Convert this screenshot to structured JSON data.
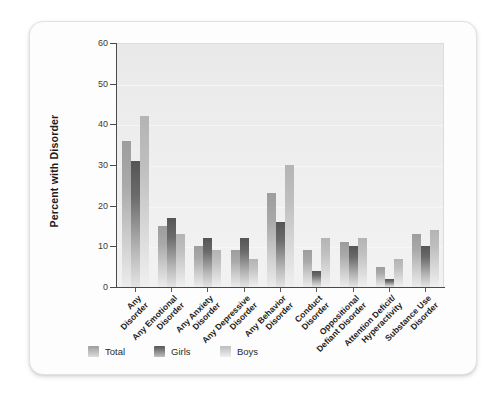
{
  "chart_data": {
    "type": "bar",
    "title": "",
    "xlabel": "",
    "ylabel": "Percent with Disorder",
    "ylim": [
      0,
      60
    ],
    "yticks": [
      0,
      10,
      20,
      30,
      40,
      50,
      60
    ],
    "grid": true,
    "legend_position": "bottom",
    "categories": [
      "Any Disorder",
      "Any Emotional Disorder",
      "Any Anxiety Disorder",
      "Any Depressive Disorder",
      "Any Behavior Disorder",
      "Conduct Disorder",
      "Oppositional Defiant Disorder",
      "Attention Deficit/Hyperactivity",
      "Substance Use Disorder"
    ],
    "category_lines": [
      [
        "Any",
        "Disorder"
      ],
      [
        "Any Emotional",
        "Disorder"
      ],
      [
        "Any Anxiety",
        "Disorder"
      ],
      [
        "Any Depressive",
        "Disorder"
      ],
      [
        "Any Behavior",
        "Disorder"
      ],
      [
        "Conduct",
        "Disorder"
      ],
      [
        "Oppositional",
        "Defiant Disorder"
      ],
      [
        "Attention Deficit/",
        "Hyperactivity"
      ],
      [
        "Substance Use",
        "Disorder"
      ]
    ],
    "series": [
      {
        "name": "Total",
        "color": "#a9a9a9",
        "values": [
          36,
          15,
          10,
          9,
          23,
          9,
          11,
          5,
          13
        ]
      },
      {
        "name": "Girls",
        "color": "#5e5e5e",
        "values": [
          31,
          17,
          12,
          12,
          16,
          4,
          10,
          2,
          10
        ]
      },
      {
        "name": "Boys",
        "color": "#c6c6c6",
        "values": [
          42,
          13,
          9,
          7,
          30,
          12,
          12,
          7,
          14
        ]
      }
    ]
  },
  "legend": {
    "items": [
      {
        "label": "Total",
        "key": "total"
      },
      {
        "label": "Girls",
        "key": "girls"
      },
      {
        "label": "Boys",
        "key": "boys"
      }
    ]
  }
}
